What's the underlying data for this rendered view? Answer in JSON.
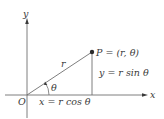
{
  "diagram": {
    "axes": {
      "x_label": "x",
      "y_label": "y",
      "origin_label": "O"
    },
    "point": {
      "label": "P = (r, θ)"
    },
    "segments": {
      "radius_label": "r",
      "angle_label": "θ"
    },
    "equations": {
      "vertical": "y = r sin θ",
      "horizontal": "x = r cos θ"
    },
    "colors": {
      "line": "#6f6f6f",
      "text": "#3a3a3a",
      "point": "#2b2b2b"
    }
  }
}
